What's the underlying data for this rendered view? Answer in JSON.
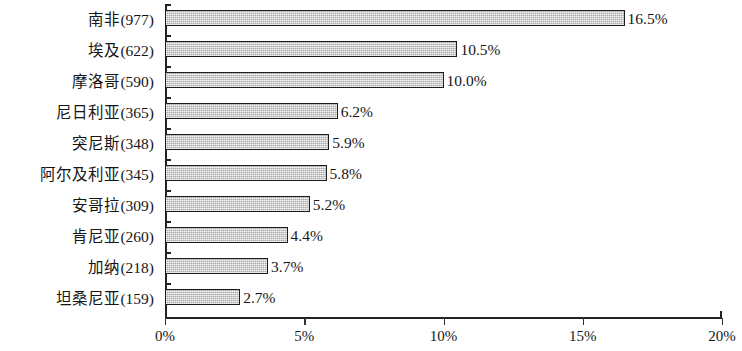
{
  "chart_data": {
    "type": "bar",
    "orientation": "horizontal",
    "title": "",
    "xlabel": "",
    "ylabel": "",
    "xlim": [
      0,
      20
    ],
    "grid": false,
    "legend": null,
    "xticks": [
      "0%",
      "5%",
      "10%",
      "15%",
      "20%"
    ],
    "xtick_values": [
      0,
      5,
      10,
      15,
      20
    ],
    "categories": [
      "南非(977)",
      "埃及(622)",
      "摩洛哥(590)",
      "尼日利亚(365)",
      "突尼斯(348)",
      "阿尔及利亚(345)",
      "安哥拉(309)",
      "肯尼亚(260)",
      "加纳(218)",
      "坦桑尼亚(159)"
    ],
    "values": [
      16.5,
      10.5,
      10.0,
      6.2,
      5.9,
      5.8,
      5.2,
      4.4,
      3.7,
      2.7
    ],
    "data_labels": [
      "16.5%",
      "10.5%",
      "10.0%",
      "6.2%",
      "5.9%",
      "5.8%",
      "5.2%",
      "4.4%",
      "3.7%",
      "2.7%"
    ],
    "counts": [
      977,
      622,
      590,
      365,
      348,
      345,
      309,
      260,
      218,
      159
    ],
    "colors": {
      "bar_fill": "#c9c9c9",
      "bar_border": "#1c1c1c",
      "axis": "#222222",
      "text": "#161616",
      "background": "#ffffff"
    }
  }
}
